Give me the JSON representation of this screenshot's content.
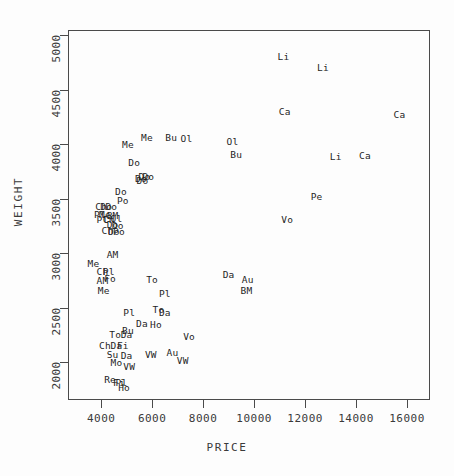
{
  "chart_data": {
    "type": "scatter",
    "title": "",
    "xlabel": "PRICE",
    "ylabel": "WEIGHT",
    "xlim": [
      2700,
      16900
    ],
    "ylim": [
      1650,
      5050
    ],
    "xticks": [
      4000,
      6000,
      8000,
      10000,
      12000,
      14000,
      16000
    ],
    "yticks": [
      2000,
      2500,
      3000,
      3500,
      4000,
      4500,
      5000
    ],
    "xtick_labels": [
      "4000",
      "6000",
      "8000",
      "10000",
      "12000",
      "14000",
      "16000"
    ],
    "ytick_labels": [
      "2000",
      "2500",
      "3000",
      "3500",
      "4000",
      "4500",
      "5000"
    ],
    "grid": false,
    "legend": false,
    "marker_style": "text-label",
    "points": [
      {
        "label": "Li",
        "x": 11150,
        "y": 4800
      },
      {
        "label": "Li",
        "x": 12700,
        "y": 4700
      },
      {
        "label": "Ca",
        "x": 11200,
        "y": 4300
      },
      {
        "label": "Ca",
        "x": 15700,
        "y": 4270
      },
      {
        "label": "Ol",
        "x": 7350,
        "y": 4050
      },
      {
        "label": "Ol",
        "x": 9150,
        "y": 4020
      },
      {
        "label": "Bu",
        "x": 6750,
        "y": 4060
      },
      {
        "label": "Me",
        "x": 5800,
        "y": 4060
      },
      {
        "label": "Me",
        "x": 5050,
        "y": 3990
      },
      {
        "label": "Bu",
        "x": 9300,
        "y": 3900
      },
      {
        "label": "Li",
        "x": 13200,
        "y": 3880
      },
      {
        "label": "Ca",
        "x": 14350,
        "y": 3890
      },
      {
        "label": "Do",
        "x": 5300,
        "y": 3830
      },
      {
        "label": "Do",
        "x": 5700,
        "y": 3700
      },
      {
        "label": "Do",
        "x": 5850,
        "y": 3700
      },
      {
        "label": "Do",
        "x": 5560,
        "y": 3680
      },
      {
        "label": "Do",
        "x": 5620,
        "y": 3660
      },
      {
        "label": "Pe",
        "x": 12450,
        "y": 3520
      },
      {
        "label": "Do",
        "x": 4780,
        "y": 3560
      },
      {
        "label": "Po",
        "x": 4850,
        "y": 3480
      },
      {
        "label": "Vo",
        "x": 11300,
        "y": 3300
      },
      {
        "label": "Ch",
        "x": 4000,
        "y": 3420
      },
      {
        "label": "Do",
        "x": 4200,
        "y": 3420
      },
      {
        "label": "Do",
        "x": 4400,
        "y": 3420
      },
      {
        "label": "Pl",
        "x": 3950,
        "y": 3350
      },
      {
        "label": "Me",
        "x": 4150,
        "y": 3350
      },
      {
        "label": "BM",
        "x": 4450,
        "y": 3340
      },
      {
        "label": "Pl",
        "x": 4050,
        "y": 3300
      },
      {
        "label": "Ch",
        "x": 4300,
        "y": 3300
      },
      {
        "label": "Ol",
        "x": 4600,
        "y": 3310
      },
      {
        "label": "Do",
        "x": 4450,
        "y": 3260
      },
      {
        "label": "Do",
        "x": 4650,
        "y": 3250
      },
      {
        "label": "Ch",
        "x": 4250,
        "y": 3200
      },
      {
        "label": "Do",
        "x": 4500,
        "y": 3190
      },
      {
        "label": "Po",
        "x": 4700,
        "y": 3190
      },
      {
        "label": "AM",
        "x": 4450,
        "y": 2980
      },
      {
        "label": "Me",
        "x": 3700,
        "y": 2900
      },
      {
        "label": "Da",
        "x": 9000,
        "y": 2800
      },
      {
        "label": "Ch",
        "x": 4050,
        "y": 2830
      },
      {
        "label": "Pl",
        "x": 4300,
        "y": 2830
      },
      {
        "label": "Au",
        "x": 9750,
        "y": 2750
      },
      {
        "label": "AM",
        "x": 4050,
        "y": 2740
      },
      {
        "label": "To",
        "x": 6000,
        "y": 2750
      },
      {
        "label": "Fo",
        "x": 4350,
        "y": 2760
      },
      {
        "label": "Me",
        "x": 4100,
        "y": 2650
      },
      {
        "label": "BM",
        "x": 9700,
        "y": 2650
      },
      {
        "label": "Pl",
        "x": 6500,
        "y": 2620
      },
      {
        "label": "To",
        "x": 6250,
        "y": 2480
      },
      {
        "label": "Da",
        "x": 6500,
        "y": 2450
      },
      {
        "label": "Pl",
        "x": 5100,
        "y": 2450
      },
      {
        "label": "Da",
        "x": 5600,
        "y": 2350
      },
      {
        "label": "Ho",
        "x": 6150,
        "y": 2340
      },
      {
        "label": "To",
        "x": 4550,
        "y": 2250
      },
      {
        "label": "Bu",
        "x": 5050,
        "y": 2280
      },
      {
        "label": "Da",
        "x": 5000,
        "y": 2250
      },
      {
        "label": "Vo",
        "x": 7450,
        "y": 2230
      },
      {
        "label": "Ch",
        "x": 4150,
        "y": 2150
      },
      {
        "label": "Da",
        "x": 4600,
        "y": 2150
      },
      {
        "label": "Fi",
        "x": 4850,
        "y": 2150
      },
      {
        "label": "Su",
        "x": 4450,
        "y": 2060
      },
      {
        "label": "Da",
        "x": 5000,
        "y": 2050
      },
      {
        "label": "VW",
        "x": 5950,
        "y": 2060
      },
      {
        "label": "Au",
        "x": 6800,
        "y": 2080
      },
      {
        "label": "VW",
        "x": 7200,
        "y": 2010
      },
      {
        "label": "Mo",
        "x": 4600,
        "y": 1990
      },
      {
        "label": "VW",
        "x": 5100,
        "y": 1950
      },
      {
        "label": "Re",
        "x": 4350,
        "y": 1830
      },
      {
        "label": "Fi",
        "x": 4700,
        "y": 1810
      },
      {
        "label": "Pl",
        "x": 4800,
        "y": 1810
      },
      {
        "label": "Ho",
        "x": 4900,
        "y": 1760
      }
    ]
  },
  "axes": {
    "y_title": "WEIGHT",
    "x_title": "PRICE"
  },
  "colors": {
    "frame": "#4a4a4a",
    "text": "#1f1f1f",
    "tick_text": "#3a3a3a",
    "background": "#fdfdfd"
  }
}
